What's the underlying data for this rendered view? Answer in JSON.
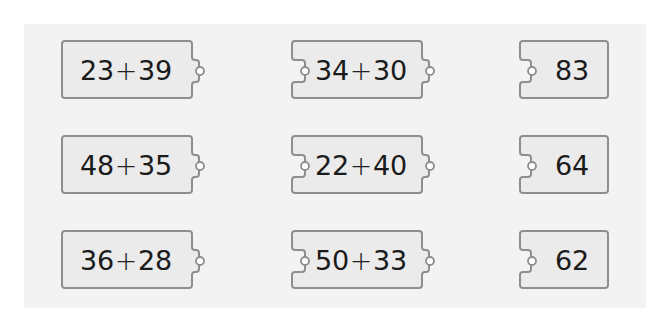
{
  "puzzle": {
    "colors": {
      "page_background": "#ffffff",
      "panel_background": "#f3f3f3",
      "piece_fill": "#ebebeb",
      "piece_stroke": "#8e8e8e",
      "knob_fill": "#ffffff",
      "text": "#1b1b1b"
    },
    "rows": [
      {
        "left": {
          "a": "23",
          "op": "+",
          "b": "39"
        },
        "middle": {
          "a": "34",
          "op": "+",
          "b": "30"
        },
        "right": {
          "value": "83"
        }
      },
      {
        "left": {
          "a": "48",
          "op": "+",
          "b": "35"
        },
        "middle": {
          "a": "22",
          "op": "+",
          "b": "40"
        },
        "right": {
          "value": "64"
        }
      },
      {
        "left": {
          "a": "36",
          "op": "+",
          "b": "28"
        },
        "middle": {
          "a": "50",
          "op": "+",
          "b": "33"
        },
        "right": {
          "value": "62"
        }
      }
    ]
  }
}
